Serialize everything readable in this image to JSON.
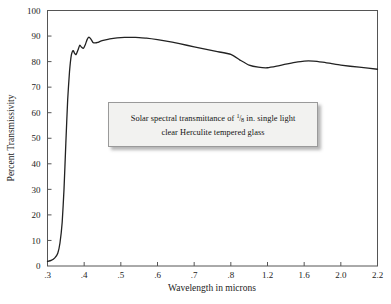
{
  "chart_data": {
    "type": "line",
    "title": "",
    "xlabel": "Wavelength in microns",
    "ylabel": "Percent Transmissivity",
    "x_tick_labels": [
      ".3",
      ".4",
      ".5",
      ".6",
      ".7",
      ".8",
      "1.2",
      "1.6",
      "2.0",
      "2.2"
    ],
    "x_tick_values": [
      0.3,
      0.4,
      0.5,
      0.6,
      0.7,
      0.8,
      1.2,
      1.6,
      2.0,
      2.2
    ],
    "y_tick_labels": [
      "0",
      "10",
      "20",
      "30",
      "40",
      "50",
      "60",
      "70",
      "80",
      "90",
      "100"
    ],
    "y_tick_values": [
      0,
      10,
      20,
      30,
      40,
      50,
      60,
      70,
      80,
      90,
      100
    ],
    "ylim": [
      0,
      100
    ],
    "xlim": [
      0.3,
      2.2
    ],
    "x_scale": "piecewise-compressed",
    "grid": false,
    "legend": "none",
    "line_color": "#222222",
    "series": [
      {
        "name": "Transmissivity",
        "x": [
          0.3,
          0.31,
          0.32,
          0.328,
          0.334,
          0.34,
          0.345,
          0.35,
          0.355,
          0.36,
          0.365,
          0.37,
          0.374,
          0.378,
          0.383,
          0.388,
          0.393,
          0.398,
          0.403,
          0.408,
          0.413,
          0.418,
          0.424,
          0.43,
          0.437,
          0.445,
          0.455,
          0.47,
          0.49,
          0.51,
          0.53,
          0.55,
          0.57,
          0.6,
          0.64,
          0.68,
          0.72,
          0.76,
          0.8,
          0.9,
          1.0,
          1.1,
          1.2,
          1.3,
          1.4,
          1.5,
          1.6,
          1.7,
          1.8,
          1.9,
          2.0,
          2.1,
          2.2
        ],
        "y": [
          1.8,
          2.2,
          3.2,
          5.0,
          9.0,
          17.0,
          30.0,
          48.0,
          65.0,
          76.0,
          82.5,
          84.3,
          83.2,
          82.8,
          84.5,
          86.4,
          85.6,
          85.2,
          86.6,
          88.6,
          89.6,
          88.9,
          87.5,
          87.3,
          87.5,
          88.0,
          88.4,
          88.9,
          89.3,
          89.5,
          89.5,
          89.4,
          89.2,
          88.6,
          87.6,
          86.4,
          85.2,
          84.0,
          82.8,
          80.6,
          78.6,
          77.8,
          77.6,
          78.2,
          79.0,
          79.7,
          80.2,
          80.2,
          79.8,
          79.2,
          78.6,
          77.8,
          77.0
        ]
      }
    ],
    "annotation": {
      "line1_pre": "Solar spectral transmittance of ",
      "fraction_numerator": "1",
      "fraction_bar": "/",
      "fraction_denominator": "8",
      "line1_post": " in. single light",
      "line2": "clear Herculite tempered glass"
    }
  }
}
